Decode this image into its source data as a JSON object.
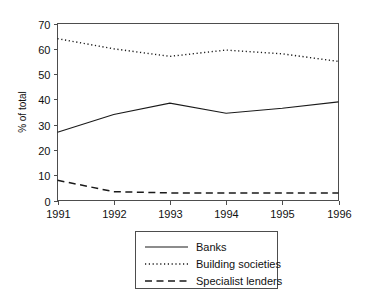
{
  "chart_data": {
    "type": "line",
    "title": "",
    "xlabel": "",
    "ylabel": "% of total",
    "categories": [
      "1991",
      "1992",
      "1993",
      "1994",
      "1995",
      "1996"
    ],
    "x": [
      1991,
      1992,
      1993,
      1994,
      1995,
      1996
    ],
    "xlim": [
      1991,
      1996
    ],
    "ylim": [
      0,
      70
    ],
    "yticks": [
      0,
      10,
      20,
      30,
      40,
      50,
      60,
      70
    ],
    "ytick_labels": [
      "0",
      "10",
      "20",
      "30",
      "40",
      "50",
      "60",
      "70"
    ],
    "xtick_labels": [
      "1991",
      "1992",
      "1993",
      "1994",
      "1995",
      "1996"
    ],
    "grid": false,
    "legend_position": "bottom-center",
    "series": [
      {
        "name": "Banks",
        "style": "solid",
        "color": "#1a1a1a",
        "values": [
          27,
          34,
          38.5,
          34.5,
          36.5,
          39
        ]
      },
      {
        "name": "Building societies",
        "style": "dotted",
        "color": "#1a1a1a",
        "values": [
          64,
          60,
          57,
          59.5,
          58,
          55
        ]
      },
      {
        "name": "Specialist lenders",
        "style": "dashed",
        "color": "#1a1a1a",
        "values": [
          8,
          3.5,
          3,
          3,
          3,
          3
        ]
      }
    ]
  },
  "legend": {
    "items": [
      {
        "label": "Banks",
        "style": "solid"
      },
      {
        "label": "Building societies",
        "style": "dotted"
      },
      {
        "label": "Specialist lenders",
        "style": "dashed"
      }
    ]
  },
  "colors": {
    "background": "#ffffff",
    "axis": "#4d4d4d",
    "ink": "#1a1a1a"
  }
}
